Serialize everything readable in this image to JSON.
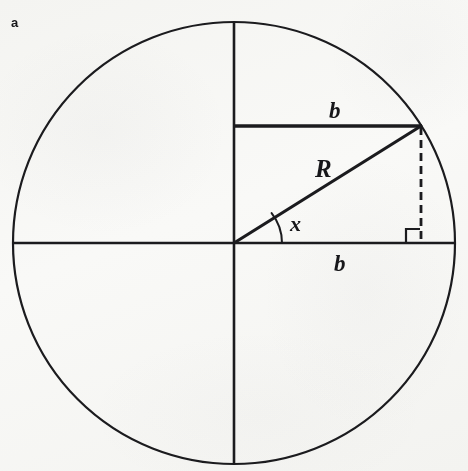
{
  "figure": {
    "panel_label": "a",
    "stroke_color": "#17171a",
    "background_color": "#fbfbfa",
    "labels": {
      "radius": "R",
      "angle": "x",
      "horizontal_leg": "b",
      "vertical_chord": "b"
    },
    "geometry": {
      "circle": {
        "cx": 234,
        "cy": 243,
        "r": 221
      },
      "vertical_axis": {
        "x": 234,
        "y1": 22,
        "y2": 464
      },
      "horizontal_axis": {
        "y": 243,
        "x1": 13,
        "x2": 455
      },
      "chord_b": {
        "y": 126,
        "x1": 234,
        "x2": 421
      },
      "hypotenuse_R": {
        "x1": 234,
        "y1": 243,
        "x2": 421,
        "y2": 126
      },
      "dashed_drop": {
        "x": 421,
        "y1": 126,
        "y2": 243
      },
      "right_angle_marker": {
        "x": 406,
        "y": 229,
        "size": 14
      },
      "angle_arc_radius": 48
    },
    "label_positions": {
      "panel_label": {
        "x": 11,
        "y": 16
      },
      "b_top": {
        "x": 329,
        "y": 99
      },
      "R": {
        "x": 315,
        "y": 156
      },
      "x": {
        "x": 290,
        "y": 213
      },
      "b_bottom": {
        "x": 334,
        "y": 252
      }
    }
  }
}
